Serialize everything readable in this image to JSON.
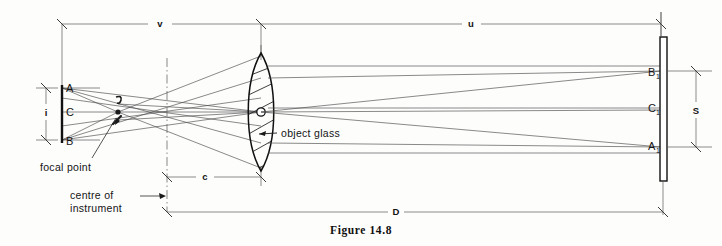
{
  "figure": {
    "caption": "Figure 14.8"
  },
  "diagram": {
    "type": "optical-ray-diagram",
    "left_staff": {
      "name": "staff-image-plane",
      "points": [
        {
          "id": "A",
          "label": "A",
          "x": 62,
          "y": 88
        },
        {
          "id": "C",
          "label": "C",
          "x": 62,
          "y": 112
        },
        {
          "id": "B",
          "label": "B",
          "x": 62,
          "y": 140
        }
      ],
      "dimension_label": "i"
    },
    "right_staff": {
      "name": "staff-object-plane",
      "points": [
        {
          "id": "B1",
          "label": "B",
          "sub": "1",
          "x": 661,
          "y": 71
        },
        {
          "id": "C1",
          "label": "C",
          "sub": "1",
          "x": 661,
          "y": 110
        },
        {
          "id": "A1",
          "label": "A",
          "sub": "1",
          "x": 661,
          "y": 147
        }
      ],
      "dimension_label": "S"
    },
    "lens": {
      "label": "object glass",
      "center_x": 261,
      "center_y": 112
    },
    "focal_point": {
      "label": "focal point",
      "marker": "F",
      "x": 118,
      "y": 112
    },
    "centre_line": {
      "label_line1": "centre of",
      "label_line2": "instrument",
      "x": 167
    },
    "dimensions": [
      {
        "id": "v",
        "label": "v",
        "from": "left-staff",
        "to": "object-glass",
        "y": 24
      },
      {
        "id": "u",
        "label": "u",
        "from": "object-glass",
        "to": "right-staff",
        "y": 24
      },
      {
        "id": "c",
        "label": "c",
        "from": "centre-of-instrument",
        "to": "object-glass",
        "y": 177
      },
      {
        "id": "D",
        "label": "D",
        "from": "centre-of-instrument",
        "to": "right-staff",
        "y": 212
      },
      {
        "id": "i",
        "label": "i",
        "from": "A",
        "to": "B",
        "x": 46
      },
      {
        "id": "S",
        "label": "S",
        "from": "B1",
        "to": "A1",
        "x": 696
      }
    ]
  },
  "colors": {
    "ink": "#141414",
    "ray": "#4a4a4a",
    "dimension": "#5a5a5a",
    "paper": "#fdfdfc"
  }
}
